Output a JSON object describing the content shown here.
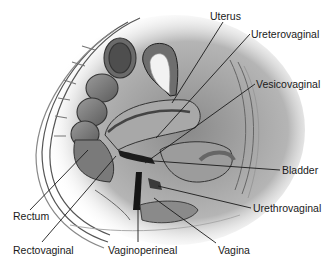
{
  "figure": {
    "type": "anatomical-illustration",
    "labels": [
      {
        "id": "uterus",
        "text": "Uterus",
        "x": 210,
        "y": 10,
        "line": [
          [
            223,
            22
          ],
          [
            172,
            103
          ]
        ]
      },
      {
        "id": "ureterovaginal",
        "text": "Ureterovaginal",
        "x": 251,
        "y": 28,
        "line": [
          [
            250,
            34
          ],
          [
            156,
            138
          ]
        ]
      },
      {
        "id": "vesicovaginal",
        "text": "Vesicovaginal",
        "x": 256,
        "y": 78,
        "line": [
          [
            255,
            84
          ],
          [
            145,
            163
          ]
        ]
      },
      {
        "id": "bladder",
        "text": "Bladder",
        "x": 282,
        "y": 164,
        "line": [
          [
            280,
            170
          ],
          [
            140,
            160
          ]
        ]
      },
      {
        "id": "urethrovaginal",
        "text": "Urethrovaginal",
        "x": 253,
        "y": 202,
        "line": [
          [
            251,
            208
          ],
          [
            158,
            186
          ]
        ]
      },
      {
        "id": "vagina",
        "text": "Vagina",
        "x": 218,
        "y": 244,
        "line": [
          [
            216,
            243
          ],
          [
            154,
            198
          ]
        ]
      },
      {
        "id": "vaginoperineal",
        "text": "Vaginoperineal",
        "x": 108,
        "y": 244,
        "line": [
          [
            138,
            242
          ],
          [
            138,
            206
          ]
        ]
      },
      {
        "id": "rectovaginal",
        "text": "Rectovaginal",
        "x": 13,
        "y": 244,
        "line": [
          [
            42,
            242
          ],
          [
            116,
            156
          ]
        ]
      },
      {
        "id": "rectum",
        "text": "Rectum",
        "x": 13,
        "y": 210,
        "line": [
          [
            30,
            210
          ],
          [
            88,
            150
          ]
        ]
      }
    ]
  },
  "colors": {
    "background": "#ffffff",
    "line": "#1a1a1a",
    "tissue_dark": "#5a5a5a",
    "tissue_mid": "#8c8c8c",
    "tissue_light": "#c4c4c4",
    "tissue_pale": "#e4e4e4"
  }
}
